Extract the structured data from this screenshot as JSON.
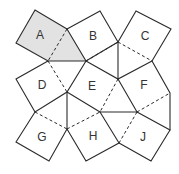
{
  "diagram": {
    "type": "pinwheel tiling of squares and triangles",
    "shaded_color": "#e2e2e2",
    "line_color": "#2a2a2a",
    "regions": [
      {
        "label": "A",
        "shaded": true,
        "x": 40,
        "y": 36
      },
      {
        "label": "B",
        "shaded": false,
        "x": 92,
        "y": 37
      },
      {
        "label": "C",
        "shaded": false,
        "x": 145,
        "y": 37
      },
      {
        "label": "D",
        "shaded": false,
        "x": 42,
        "y": 86
      },
      {
        "label": "E",
        "shaded": false,
        "x": 92,
        "y": 87
      },
      {
        "label": "F",
        "shaded": false,
        "x": 144,
        "y": 86
      },
      {
        "label": "G",
        "shaded": false,
        "x": 42,
        "y": 138
      },
      {
        "label": "H",
        "shaded": false,
        "x": 93,
        "y": 137
      },
      {
        "label": "J",
        "shaded": false,
        "x": 143,
        "y": 138
      }
    ]
  }
}
